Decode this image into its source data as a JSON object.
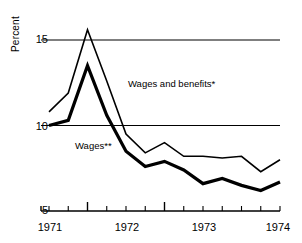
{
  "chart_data": {
    "type": "line",
    "title": "",
    "xlabel": "",
    "ylabel": "Percent",
    "ylim": [
      5,
      16.5
    ],
    "yticks": [
      5,
      10,
      15
    ],
    "ytick_labels": [
      "5",
      "10",
      "15"
    ],
    "gridlines": [
      10,
      15
    ],
    "grid": true,
    "legend_position": "inline-annotations",
    "x": [
      "1971-Q1",
      "1971-Q2",
      "1971-Q3",
      "1971-Q4",
      "1972-Q1",
      "1972-Q2",
      "1972-Q3",
      "1972-Q4",
      "1973-Q1",
      "1973-Q2",
      "1973-Q3",
      "1973-Q4",
      "1974-Q1"
    ],
    "xtick_labels": [
      "1971",
      "1972",
      "1973",
      "1974"
    ],
    "xtick_label_positions": [
      0,
      4,
      8,
      12
    ],
    "major_tick_positions": [
      2,
      6
    ],
    "series": [
      {
        "name": "Wages and benefits*",
        "style": "thin",
        "width_px": 1.6,
        "color": "#000000",
        "values": [
          10.8,
          11.9,
          15.6,
          12.6,
          9.5,
          8.4,
          9.0,
          8.2,
          8.2,
          8.1,
          8.2,
          7.3,
          8.0
        ]
      },
      {
        "name": "Wages**",
        "style": "thick",
        "width_px": 3.2,
        "color": "#000000",
        "values": [
          10.0,
          10.3,
          13.5,
          10.6,
          8.5,
          7.6,
          7.9,
          7.4,
          6.6,
          6.9,
          6.5,
          6.2,
          6.7
        ]
      }
    ],
    "annotations": [
      {
        "text": "Wages and benefits*",
        "x_px": 128,
        "y_px": 78
      },
      {
        "text": "Wages**",
        "x_px": 75,
        "y_px": 140
      }
    ]
  }
}
